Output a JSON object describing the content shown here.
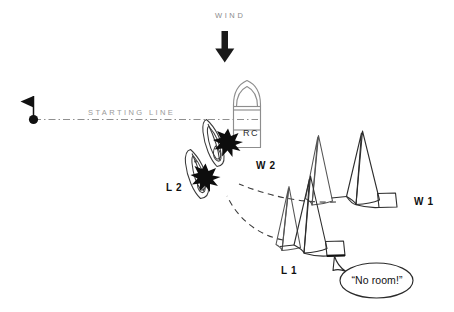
{
  "figure": {
    "background_color": "#ffffff",
    "ink_color": "#111111",
    "gray_color": "#9a9a9a"
  },
  "wind": {
    "label": "WIND",
    "label_color": "#8c8c8c",
    "arrow_direction": "down",
    "arrow_color": "#1a1a1a"
  },
  "starting_line": {
    "label": "STARTING LINE",
    "label_color": "#9a9a9a",
    "line_style": "dash-dot",
    "line_color": "#8f8f8f",
    "pin_end": "pin-buoy-flag",
    "committee_end": "rc-boat"
  },
  "rc_boat": {
    "label": "RC",
    "outline_color": "#8d8d8d",
    "description": "race committee boat, bow up"
  },
  "boats": [
    {
      "id": "W1",
      "label": "W 1",
      "role": "windward",
      "position": "1",
      "label_x": 414,
      "label_y": 196
    },
    {
      "id": "L1",
      "label": "L 1",
      "role": "leeward",
      "position": "1",
      "label_x": 281,
      "label_y": 265
    },
    {
      "id": "W2",
      "label": "W 2",
      "role": "windward",
      "position": "2",
      "label_x": 256,
      "label_y": 162
    },
    {
      "id": "L2",
      "label": "L 2",
      "role": "leeward",
      "position": "2",
      "label_x": 166,
      "label_y": 184
    }
  ],
  "collisions": [
    {
      "between": "W2-and-RC",
      "marker": "starburst",
      "color": "#0d0d0d"
    },
    {
      "between": "L2-and-W2",
      "marker": "starburst",
      "color": "#0d0d0d"
    }
  ],
  "tracks": [
    {
      "boat": "W1",
      "style": "dashed",
      "color": "#3a3a3a"
    },
    {
      "boat": "L1",
      "style": "dashed",
      "color": "#3a3a3a"
    }
  ],
  "speech_bubble": {
    "text": "“No room!”",
    "speaker": "L1",
    "shape": "ellipse",
    "outline_color": "#2a2a2a"
  }
}
